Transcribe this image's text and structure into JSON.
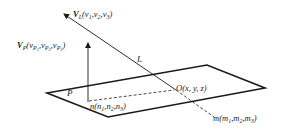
{
  "diagram": {
    "type": "geometry-line-plane-intersection",
    "colors": {
      "stroke": "#1a1a1a",
      "text": "#222222",
      "background": "#ffffff"
    },
    "plane": {
      "label": "P",
      "vertices": [
        [
          47,
          93
        ],
        [
          207,
          65
        ],
        [
          265,
          88
        ],
        [
          108,
          117
        ]
      ]
    },
    "line_L": {
      "label": "L",
      "start": [
        62,
        13
      ],
      "intersection": [
        176,
        90
      ],
      "end": [
        216,
        118
      ]
    },
    "vectors": {
      "VL": {
        "symbol": "V",
        "subscript": "L",
        "components": "(v₁, v₂, v₃)",
        "c1": "v",
        "c1s": "1",
        "c2": "v",
        "c2s": "2",
        "c3": "v",
        "c3s": "3"
      },
      "VP": {
        "symbol": "V",
        "subscript": "P",
        "c1": "v",
        "c1s": "P",
        "c1ss": "1",
        "c2": "v",
        "c2s": "P",
        "c2ss": "2",
        "c3": "v",
        "c3s": "P",
        "c3ss": "3"
      }
    },
    "points": {
      "O": {
        "name": "O",
        "coords": "(x, y, z)"
      },
      "n": {
        "name": "n",
        "c1": "n",
        "c1s": "1",
        "c2": "n",
        "c2s": "2",
        "c3": "n",
        "c3s": "3"
      },
      "m": {
        "name": "m",
        "c1": "m",
        "c1s": "1",
        "c2": "m",
        "c2s": "2",
        "c3": "m",
        "c3s": "3"
      }
    },
    "labels": {
      "plane": "P",
      "line": "L",
      "O_text": "O(x, y, z)",
      "comma": ",",
      "open": "(",
      "close": ")"
    }
  }
}
